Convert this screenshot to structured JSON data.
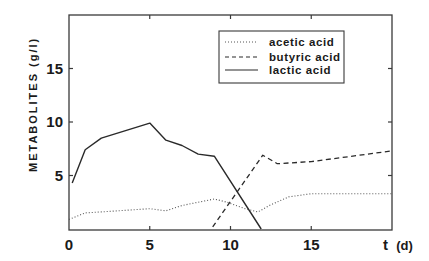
{
  "chart_data": {
    "type": "line",
    "title": "",
    "xlabel": "t (d)",
    "ylabel": "METABOLITES (g/l)",
    "xlim": [
      0,
      20
    ],
    "ylim": [
      0,
      20
    ],
    "xticks": [
      0,
      5,
      10,
      15
    ],
    "yticks": [
      5,
      10,
      15
    ],
    "xtick_labels": [
      "0",
      "5",
      "10",
      "15"
    ],
    "ytick_labels": [
      "5",
      "10",
      "15"
    ],
    "grid": false,
    "legend_position": "upper right (inside)",
    "series": [
      {
        "name": "acetic acid",
        "style": "dotted",
        "x": [
          0,
          1,
          2,
          5,
          6,
          7,
          9,
          9.8,
          10.9,
          11.7,
          12.4,
          13.6,
          15,
          20
        ],
        "y": [
          0.9,
          1.5,
          1.6,
          1.9,
          1.7,
          2.2,
          2.8,
          2.5,
          1.9,
          1.6,
          2.2,
          3.0,
          3.3,
          3.3
        ]
      },
      {
        "name": "butyric acid",
        "style": "dashed",
        "x": [
          8.9,
          12,
          12.9,
          15,
          20
        ],
        "y": [
          0.2,
          6.9,
          6.1,
          6.3,
          7.3
        ]
      },
      {
        "name": "lactic acid",
        "style": "solid",
        "x": [
          0.2,
          1,
          2,
          5,
          6,
          7,
          8,
          9,
          11.9
        ],
        "y": [
          4.3,
          7.4,
          8.5,
          9.9,
          8.3,
          7.8,
          7.0,
          6.8,
          0
        ]
      }
    ]
  },
  "legend": {
    "items": [
      {
        "label": "acetic acid",
        "style": "dotted"
      },
      {
        "label": "butyric acid",
        "style": "dashed"
      },
      {
        "label": "lactic acid",
        "style": "solid"
      }
    ]
  },
  "axes": {
    "xlabel_t": "t",
    "xlabel_unit": "(d)",
    "ylabel": "METABOLITES (g/l)"
  },
  "colors": {
    "line": "#2a2a2a",
    "axis": "#3a3a3a",
    "background": "#ffffff"
  }
}
